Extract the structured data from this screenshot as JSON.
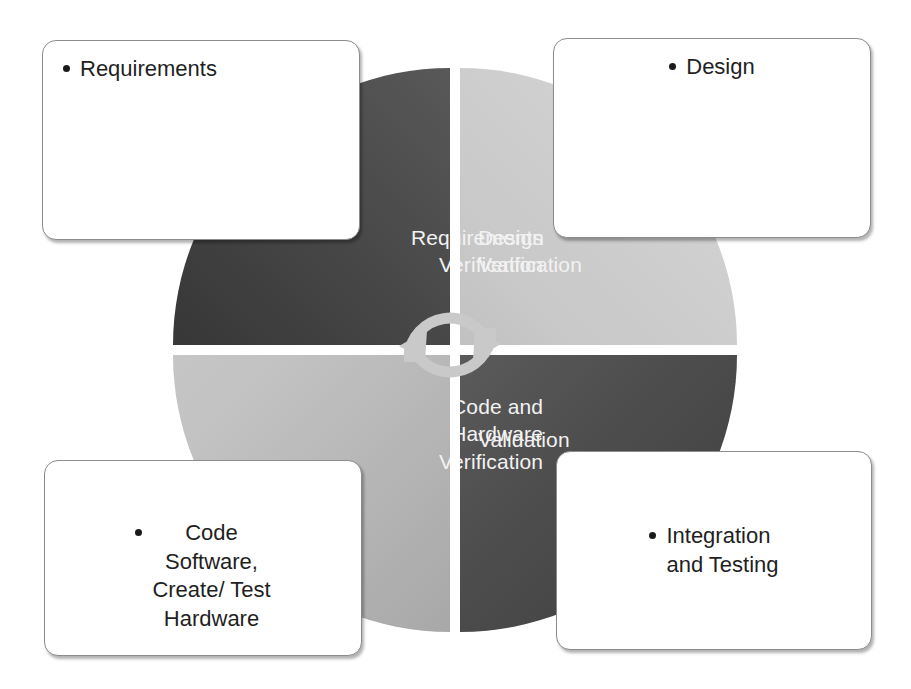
{
  "diagram": {
    "center_icon": "cycle-arrows-icon",
    "colors": {
      "requirements_verification_dark": "#2d2d2d",
      "requirements_verification_light": "#6b6b6b",
      "design_verification_light": "#d6d6d6",
      "design_verification_dark": "#9f9f9f",
      "code_verification_light": "#cfcfcf",
      "code_verification_dark": "#959595",
      "validation_dark": "#3e3e3e",
      "validation_light": "#797979",
      "label_text": "#f2f2f2",
      "callout_text": "#1f1f1f",
      "callout_border": "#8c8c8c",
      "bullet": "#1a1a1a",
      "background": "#ffffff",
      "cycle_arrow": "#c9c9c9"
    }
  },
  "quadrants": [
    {
      "id": "requirements-verification",
      "label": "Requirements\nVerification",
      "position": "top-left"
    },
    {
      "id": "design-verification",
      "label": "Design\nVerification",
      "position": "top-right"
    },
    {
      "id": "code-and-hardware-verification",
      "label": "Code and\nHardware\nVerification",
      "position": "bottom-left"
    },
    {
      "id": "validation",
      "label": "Validation",
      "position": "bottom-right"
    }
  ],
  "callouts": [
    {
      "id": "requirements",
      "text": "Requirements",
      "bullet": "•",
      "position": "top-left"
    },
    {
      "id": "design",
      "text": "Design",
      "bullet": "•",
      "position": "top-right"
    },
    {
      "id": "code-software-create-test-hardware",
      "text": "Code\nSoftware,\nCreate/ Test\nHardware",
      "bullet": "•",
      "position": "bottom-left"
    },
    {
      "id": "integration-and-testing",
      "text": "Integration\nand Testing",
      "bullet": "•",
      "position": "bottom-right"
    }
  ]
}
